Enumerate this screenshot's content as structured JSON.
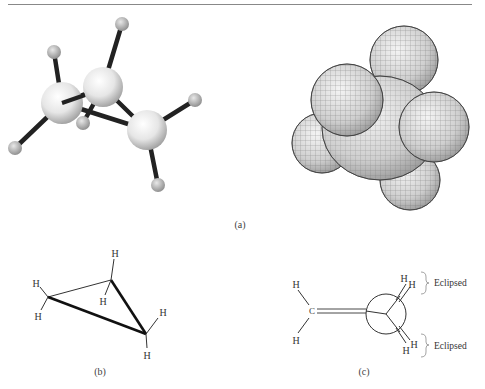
{
  "figure": {
    "panel_a": {
      "caption": "(a)",
      "ball_and_stick": {
        "description": "cyclopropane ball-and-stick model",
        "carbons": [
          {
            "x": 62,
            "y": 103
          },
          {
            "x": 103,
            "y": 87
          },
          {
            "x": 147,
            "y": 130
          }
        ],
        "hydrogens": [
          {
            "x": 54,
            "y": 52
          },
          {
            "x": 122,
            "y": 24
          },
          {
            "x": 15,
            "y": 148
          },
          {
            "x": 83,
            "y": 123
          },
          {
            "x": 195,
            "y": 100
          },
          {
            "x": 158,
            "y": 185
          }
        ]
      },
      "space_filling": {
        "description": "cyclopropane space-filling model"
      }
    },
    "panel_b": {
      "caption": "(b)",
      "atom_label": "H",
      "description": "cyclopropane perspective drawing"
    },
    "panel_c": {
      "caption": "(c)",
      "carbon_label": "C",
      "atom_label": "H",
      "annotation_top": "Eclipsed",
      "annotation_bottom": "Eclipsed",
      "description": "Newman-type projection of cyclopropane"
    }
  }
}
